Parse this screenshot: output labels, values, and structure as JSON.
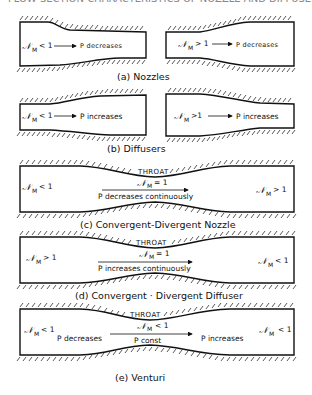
{
  "figure": {
    "top_cutoff_text": "FLOW SECTION CHARACTERISTICS OF NOZZLE AND DIFFUSERS",
    "symbol_N": "𝒩",
    "subscript_M": "M",
    "panels": {
      "a": {
        "caption": "(a) Nozzles",
        "left": {
          "mach": "< 1",
          "effect": "P decreases"
        },
        "right": {
          "mach": "> 1",
          "effect": "P decreases"
        }
      },
      "b": {
        "caption": "(b) Diffusers",
        "left": {
          "mach": "< 1",
          "effect": "P increases"
        },
        "right": {
          "mach": ">1",
          "effect": "P increases"
        }
      },
      "c": {
        "caption": "(c) Convergent-Divergent Nozzle",
        "throat_label": "THROAT",
        "inlet_mach": "< 1",
        "throat_mach": "= 1",
        "outlet_mach": "> 1",
        "effect": "P decreases continuously"
      },
      "d": {
        "caption": "(d) Convergent · Divergent Diffuser",
        "throat_label": "THROAT",
        "inlet_mach": "> 1",
        "throat_mach": "= 1",
        "outlet_mach": "< 1",
        "effect": "P increases continuously"
      },
      "e": {
        "caption": "(e) Venturi",
        "throat_label": "THROAT",
        "inlet_mach": "< 1",
        "throat_mach": "< 1",
        "outlet_mach": "< 1",
        "left_effect": "P decreases",
        "center_effect": "P const",
        "right_effect": "P increases"
      }
    }
  }
}
